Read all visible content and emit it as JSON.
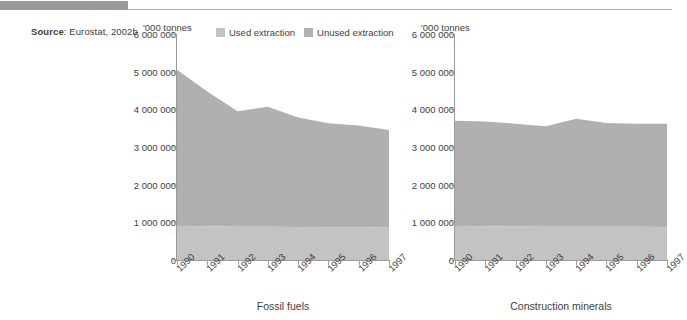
{
  "source": {
    "label": "Source",
    "separator": ": ",
    "text": "Eurostat, 2002b"
  },
  "legend": {
    "items": [
      {
        "label": "Used extraction",
        "color": "#c3c3c3",
        "icon": "square-swatch-icon"
      },
      {
        "label": "Unused extraction",
        "color": "#b0b0b0",
        "icon": "square-swatch-icon"
      }
    ]
  },
  "colors": {
    "used_extraction": "#c3c3c3",
    "unused_extraction": "#b0b0b0",
    "axis": "#9b9b9b",
    "text": "#3d3d3d",
    "banner": "#9a9a9a"
  },
  "charts": [
    {
      "id": "fossil-fuels",
      "title": "Fossil fuels",
      "unit": "'000 tonnes",
      "ytick_labels": [
        "6 000 000",
        "5 000 000",
        "4 000 000",
        "3 000 000",
        "2 000 000",
        "1 000 000",
        "0"
      ],
      "xtick_labels": [
        "1990",
        "1991",
        "1992",
        "1993",
        "1994",
        "1995",
        "1996",
        "1997"
      ]
    },
    {
      "id": "construction-minerals",
      "title": "Construction minerals",
      "unit": "'000 tonnes",
      "ytick_labels": [
        "6 000 000",
        "5 000 000",
        "4 000 000",
        "3 000 000",
        "2 000 000",
        "1 000 000",
        "0"
      ],
      "xtick_labels": [
        "1990",
        "1991",
        "1992",
        "1993",
        "1994",
        "1995",
        "1996",
        "1997"
      ]
    }
  ],
  "chart_data": [
    {
      "type": "area",
      "title": "Fossil fuels",
      "xlabel": "",
      "ylabel": "'000 tonnes",
      "ylim": [
        0,
        6000000
      ],
      "yticks": [
        0,
        1000000,
        2000000,
        3000000,
        4000000,
        5000000,
        6000000
      ],
      "grid": false,
      "stacked": true,
      "legend_position": "top",
      "categories": [
        "1990",
        "1991",
        "1992",
        "1993",
        "1994",
        "1995",
        "1996",
        "1997"
      ],
      "series": [
        {
          "name": "Used extraction",
          "values": [
            900000,
            895000,
            885000,
            880000,
            875000,
            870000,
            870000,
            865000
          ]
        },
        {
          "name": "Unused extraction",
          "values": [
            4150000,
            3580000,
            3065000,
            3190000,
            2905000,
            2760000,
            2700000,
            2585000
          ]
        }
      ],
      "totals": [
        5050000,
        4475000,
        3950000,
        4070000,
        3780000,
        3630000,
        3570000,
        3450000
      ]
    },
    {
      "type": "area",
      "title": "Construction minerals",
      "xlabel": "",
      "ylabel": "'000 tonnes",
      "ylim": [
        0,
        6000000
      ],
      "yticks": [
        0,
        1000000,
        2000000,
        3000000,
        4000000,
        5000000,
        6000000
      ],
      "grid": false,
      "stacked": true,
      "legend_position": "top",
      "categories": [
        "1990",
        "1991",
        "1992",
        "1993",
        "1994",
        "1995",
        "1996",
        "1997"
      ],
      "series": [
        {
          "name": "Used extraction",
          "values": [
            900000,
            895000,
            890000,
            885000,
            885000,
            880000,
            880000,
            875000
          ]
        },
        {
          "name": "Unused extraction",
          "values": [
            2800000,
            2785000,
            2730000,
            2665000,
            2865000,
            2760000,
            2740000,
            2745000
          ]
        }
      ],
      "totals": [
        3700000,
        3680000,
        3620000,
        3550000,
        3750000,
        3640000,
        3620000,
        3620000
      ]
    }
  ]
}
